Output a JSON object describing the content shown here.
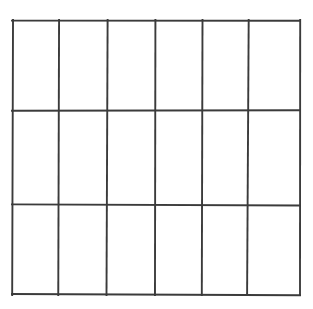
{
  "figure": {
    "kind": "grid-diagram",
    "title": "",
    "background_color": "#ffffff",
    "line_color": "#3b3b3b",
    "line_width_px": 2,
    "has_text": false,
    "has_labels": false,
    "cells_empty": true
  },
  "grid": {
    "columns": 6,
    "rows": 3,
    "total_cells": 18,
    "outer_border": {
      "left_px": 12,
      "top_px": 20,
      "right_px": 300,
      "bottom_px": 295,
      "width_px": 288,
      "height_px": 275
    },
    "vertical_line_x": [
      12,
      59,
      107,
      155,
      202,
      248,
      300
    ],
    "horizontal_line_y": [
      20,
      110,
      205,
      295
    ],
    "column_widths_px": [
      47,
      48,
      48,
      47,
      46,
      52
    ],
    "row_heights_px": [
      90,
      95,
      90
    ]
  },
  "cells": [
    {
      "row": 0,
      "col": 0,
      "label": ""
    },
    {
      "row": 0,
      "col": 1,
      "label": ""
    },
    {
      "row": 0,
      "col": 2,
      "label": ""
    },
    {
      "row": 0,
      "col": 3,
      "label": ""
    },
    {
      "row": 0,
      "col": 4,
      "label": ""
    },
    {
      "row": 0,
      "col": 5,
      "label": ""
    },
    {
      "row": 1,
      "col": 0,
      "label": ""
    },
    {
      "row": 1,
      "col": 1,
      "label": ""
    },
    {
      "row": 1,
      "col": 2,
      "label": ""
    },
    {
      "row": 1,
      "col": 3,
      "label": ""
    },
    {
      "row": 1,
      "col": 4,
      "label": ""
    },
    {
      "row": 1,
      "col": 5,
      "label": ""
    },
    {
      "row": 2,
      "col": 0,
      "label": ""
    },
    {
      "row": 2,
      "col": 1,
      "label": ""
    },
    {
      "row": 2,
      "col": 2,
      "label": ""
    },
    {
      "row": 2,
      "col": 3,
      "label": ""
    },
    {
      "row": 2,
      "col": 4,
      "label": ""
    },
    {
      "row": 2,
      "col": 5,
      "label": ""
    }
  ]
}
